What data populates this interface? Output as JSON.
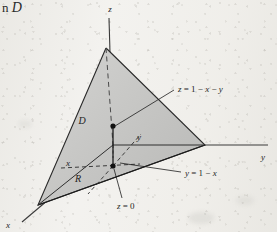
{
  "figure": {
    "type": "3d-solid-region-diagram",
    "caption_fragment": {
      "text": "n",
      "variable": "D"
    },
    "axes": [
      {
        "id": "z",
        "label": "z",
        "direction": "up",
        "label_x": 110,
        "label_y": 12
      },
      {
        "id": "y",
        "label": "y",
        "direction": "right",
        "label_x": 263,
        "label_y": 160
      },
      {
        "id": "x",
        "label": "x",
        "direction": "down-left",
        "label_x": 8,
        "label_y": 228
      }
    ],
    "region_labels": [
      {
        "id": "solid-D",
        "label": "D",
        "x": 82,
        "y": 124
      },
      {
        "id": "region-R",
        "label": "R",
        "x": 78,
        "y": 182
      },
      {
        "id": "coord-x",
        "label": "x",
        "x": 68,
        "y": 166
      },
      {
        "id": "coord-y",
        "label": "y",
        "x": 139,
        "y": 140
      }
    ],
    "annotations": [
      {
        "id": "top-surface",
        "text": "z = 1 − x − y",
        "label_x": 178,
        "label_y": 89,
        "leader_from": {
          "x": 174,
          "y": 90
        },
        "leader_to": {
          "x": 115,
          "y": 126
        }
      },
      {
        "id": "slant-boundary",
        "text": "y = 1 − x",
        "label_x": 185,
        "label_y": 175,
        "leader_from": {
          "x": 181,
          "y": 172
        },
        "leader_to": {
          "x": 120,
          "y": 163
        }
      },
      {
        "id": "bottom-surface",
        "text": "z = 0",
        "label_x": 117,
        "label_y": 206,
        "leader_from": {
          "x": 122,
          "y": 198
        },
        "leader_to": {
          "x": 114,
          "y": 168
        }
      }
    ],
    "points": [
      {
        "id": "upper-point",
        "x": 113,
        "y": 126
      },
      {
        "id": "lower-point",
        "x": 113,
        "y": 166
      }
    ],
    "vertices": {
      "apex": {
        "x": 106,
        "y": 48
      },
      "origin": {
        "x": 113,
        "y": 145
      },
      "right_base": {
        "x": 205,
        "y": 145
      },
      "front_base": {
        "x": 38,
        "y": 205
      }
    },
    "colors": {
      "background": "#f3f2ef",
      "left_face": "#dedddb",
      "right_face": "#c9c9c7",
      "base_dark": "#9a9a99",
      "base_mid": "#adadac",
      "stroke": "#1e1e1e",
      "dash": "#333333",
      "text": "#1e1e1e"
    }
  }
}
